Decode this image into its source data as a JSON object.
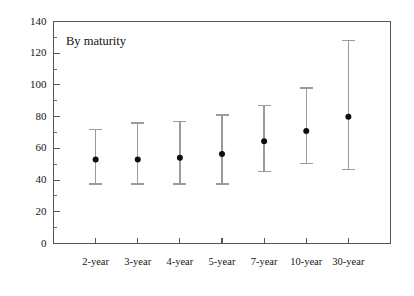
{
  "chart_data": {
    "type": "scatter",
    "title": "",
    "annotation": "By maturity",
    "xlabel": "",
    "ylabel": "",
    "categories": [
      "2-year",
      "3-year",
      "4-year",
      "5-year",
      "7-year",
      "10-year",
      "30-year"
    ],
    "ylim": [
      0,
      140
    ],
    "yticks": [
      0,
      20,
      40,
      60,
      80,
      100,
      120,
      140
    ],
    "ytick_labels": [
      "0",
      "20",
      "40",
      "60",
      "80",
      "100",
      "120",
      "140"
    ],
    "yminor_ticks": [
      10,
      30,
      50,
      70,
      90,
      110,
      130
    ],
    "grid": false,
    "legend": "none",
    "series": [
      {
        "name": "High",
        "values": [
          72,
          76,
          77,
          81,
          87,
          98,
          128
        ]
      },
      {
        "name": "Median",
        "values": [
          53,
          53,
          54,
          56.5,
          64.5,
          71,
          80
        ]
      },
      {
        "name": "Low",
        "values": [
          37.5,
          37.5,
          37.5,
          37.5,
          45.5,
          50.5,
          46.5
        ]
      }
    ],
    "colors": {
      "range": "#9a9a9f",
      "marker": "#0d0d0d",
      "axis": "#55555a",
      "background": "#ffffff"
    }
  }
}
